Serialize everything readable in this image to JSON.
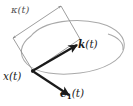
{
  "figure": {
    "background_color": "#ffffff",
    "width": 133,
    "height": 106
  },
  "colors": {
    "curve": "#a9a9a9",
    "bracket": "#8c8c8c",
    "vector": "#1a1a1a",
    "label": "#1a1a1a",
    "label_gray": "#555555"
  },
  "labels": {
    "curvature": {
      "symbol": "κ",
      "argument": "(t)",
      "full": "κ(t)"
    },
    "k_vector": {
      "symbol": "k",
      "argument": "(t)",
      "full": "k(t)"
    },
    "position": {
      "symbol": "x",
      "argument": "(t)",
      "full": "x(t)"
    },
    "e1_vector": {
      "symbol": "e",
      "subscript": "1",
      "argument": "(t)",
      "full": "e₁(t)"
    }
  },
  "geometry": {
    "origin_point": {
      "x": 33,
      "y": 71
    },
    "k_arrow_tip": {
      "x": 77,
      "y": 45
    },
    "e1_arrow_tip": {
      "x": 69,
      "y": 95
    },
    "bracket_left_vertex": {
      "x": 13,
      "y": 38
    },
    "bracket_top_vertex": {
      "x": 61,
      "y": 6
    }
  }
}
